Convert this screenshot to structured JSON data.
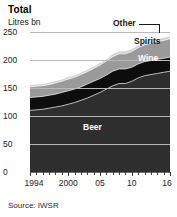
{
  "header": {
    "title": "Total",
    "subtitle": "Litres bn"
  },
  "source": "Source: IWSR",
  "labels": {
    "beer": "Beer",
    "wine": "Wine",
    "spirits": "Spirits",
    "other": "Other"
  },
  "colors": {
    "beer": "#2e2e2e",
    "wine": "#0d0d0d",
    "spirits": "#9a9a9a",
    "other": "#d4d4d4",
    "gridline": "#b9b9b9",
    "axis": "#6f6f6f",
    "text": "#1a1a1a",
    "background": "#ffffff"
  },
  "chart_data": {
    "type": "area",
    "title": "Total",
    "subtitle": "Litres bn",
    "xlabel": "",
    "ylabel": "Litres bn",
    "ylim": [
      0,
      250
    ],
    "yticks": [
      0,
      50,
      100,
      150,
      200,
      250
    ],
    "ytick_labels": [
      "0",
      "50",
      "100",
      "150",
      "200",
      "250"
    ],
    "xlim": [
      1994,
      2016
    ],
    "x": [
      1994,
      1995,
      1996,
      1997,
      1998,
      1999,
      2000,
      2001,
      2002,
      2003,
      2004,
      2005,
      2006,
      2007,
      2008,
      2009,
      2010,
      2011,
      2012,
      2013,
      2014,
      2015,
      2016
    ],
    "xtick_labels": [
      "1994",
      "2000",
      "05",
      "10",
      "16"
    ],
    "xtick_values": [
      1994,
      2000,
      2005,
      2010,
      2016
    ],
    "stacked": true,
    "grid": true,
    "legend": "inline-annotations",
    "source": "Source: IWSR",
    "series": [
      {
        "name": "Beer",
        "color": "#2e2e2e",
        "values": [
          110,
          111,
          112,
          114,
          116,
          118,
          121,
          124,
          128,
          132,
          137,
          142,
          148,
          154,
          158,
          158,
          162,
          168,
          172,
          174,
          176,
          178,
          180
        ]
      },
      {
        "name": "Wine",
        "color": "#0d0d0d",
        "values": [
          23,
          23,
          23,
          23,
          23,
          24,
          24,
          24,
          24,
          25,
          25,
          25,
          25,
          26,
          26,
          26,
          25,
          25,
          25,
          25,
          25,
          25,
          25
        ]
      },
      {
        "name": "Spirits",
        "color": "#9a9a9a",
        "values": [
          19,
          19,
          19,
          19,
          20,
          20,
          21,
          21,
          22,
          22,
          23,
          24,
          25,
          26,
          27,
          27,
          28,
          29,
          30,
          31,
          32,
          32,
          33
        ]
      },
      {
        "name": "Other",
        "color": "#d4d4d4",
        "values": [
          4,
          4,
          4,
          4,
          4,
          4,
          4,
          4,
          4,
          4,
          4,
          4,
          4,
          5,
          5,
          5,
          5,
          5,
          5,
          5,
          5,
          5,
          5
        ]
      }
    ],
    "cumulative_totals": [
      156,
      157,
      158,
      160,
      163,
      166,
      170,
      173,
      178,
      183,
      189,
      195,
      202,
      211,
      216,
      216,
      220,
      227,
      232,
      235,
      238,
      240,
      243
    ]
  }
}
